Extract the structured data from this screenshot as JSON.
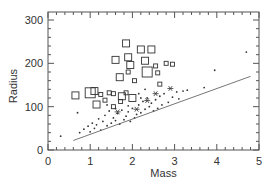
{
  "chart_data": {
    "type": "scatter",
    "title": "",
    "xlabel": "Mass",
    "ylabel": "Radius",
    "xlim": [
      0,
      5
    ],
    "ylim": [
      0,
      300
    ],
    "x_ticks": [
      0,
      1,
      2,
      3,
      4,
      5
    ],
    "x_tick_labels": [
      "0",
      "1",
      "2",
      "3",
      "4",
      "5"
    ],
    "y_ticks": [
      0,
      100,
      200,
      300
    ],
    "y_tick_labels": [
      "0",
      "100",
      "200",
      "300"
    ],
    "x_minor_step": 0.2,
    "y_minor_step": 20,
    "grid": false,
    "legend": null,
    "colors": {
      "marks": "#333333",
      "axis": "#555555",
      "fit_line": "#666666"
    },
    "series": [
      {
        "name": "squares",
        "marker": "open-square",
        "points": [
          {
            "x": 0.65,
            "y": 126,
            "s": 2
          },
          {
            "x": 1.0,
            "y": 132,
            "s": 3
          },
          {
            "x": 1.1,
            "y": 136,
            "s": 2
          },
          {
            "x": 1.15,
            "y": 105,
            "s": 2
          },
          {
            "x": 1.25,
            "y": 128,
            "s": 1
          },
          {
            "x": 1.45,
            "y": 132,
            "s": 1
          },
          {
            "x": 1.55,
            "y": 130,
            "s": 1
          },
          {
            "x": 1.6,
            "y": 208,
            "s": 2
          },
          {
            "x": 1.7,
            "y": 168,
            "s": 2
          },
          {
            "x": 1.75,
            "y": 124,
            "s": 2
          },
          {
            "x": 1.85,
            "y": 246,
            "s": 2
          },
          {
            "x": 1.9,
            "y": 214,
            "s": 2
          },
          {
            "x": 1.95,
            "y": 196,
            "s": 2
          },
          {
            "x": 1.9,
            "y": 180,
            "s": 1
          },
          {
            "x": 1.85,
            "y": 132,
            "s": 1
          },
          {
            "x": 2.0,
            "y": 120,
            "s": 2
          },
          {
            "x": 2.05,
            "y": 160,
            "s": 1
          },
          {
            "x": 2.2,
            "y": 232,
            "s": 2
          },
          {
            "x": 2.3,
            "y": 206,
            "s": 2
          },
          {
            "x": 2.35,
            "y": 180,
            "s": 3
          },
          {
            "x": 2.45,
            "y": 232,
            "s": 2
          },
          {
            "x": 2.55,
            "y": 194,
            "s": 1
          },
          {
            "x": 2.6,
            "y": 178,
            "s": 1
          },
          {
            "x": 2.65,
            "y": 152,
            "s": 1
          },
          {
            "x": 2.8,
            "y": 200,
            "s": 1
          },
          {
            "x": 2.95,
            "y": 198,
            "s": 1
          },
          {
            "x": 1.35,
            "y": 115,
            "s": 1
          },
          {
            "x": 1.55,
            "y": 100,
            "s": 1
          },
          {
            "x": 1.72,
            "y": 112,
            "s": 1
          }
        ]
      },
      {
        "name": "dots",
        "marker": "dot",
        "points": [
          {
            "x": 0.3,
            "y": 32
          },
          {
            "x": 0.7,
            "y": 86
          },
          {
            "x": 0.75,
            "y": 40
          },
          {
            "x": 0.85,
            "y": 48
          },
          {
            "x": 0.95,
            "y": 55
          },
          {
            "x": 1.0,
            "y": 42
          },
          {
            "x": 1.05,
            "y": 62
          },
          {
            "x": 1.1,
            "y": 50
          },
          {
            "x": 1.15,
            "y": 58
          },
          {
            "x": 1.2,
            "y": 72
          },
          {
            "x": 1.25,
            "y": 46
          },
          {
            "x": 1.3,
            "y": 66
          },
          {
            "x": 1.35,
            "y": 80
          },
          {
            "x": 1.4,
            "y": 56
          },
          {
            "x": 1.45,
            "y": 90
          },
          {
            "x": 1.5,
            "y": 62
          },
          {
            "x": 1.55,
            "y": 74
          },
          {
            "x": 1.6,
            "y": 68
          },
          {
            "x": 1.65,
            "y": 84
          },
          {
            "x": 1.7,
            "y": 60
          },
          {
            "x": 1.75,
            "y": 92
          },
          {
            "x": 1.8,
            "y": 70
          },
          {
            "x": 1.85,
            "y": 78
          },
          {
            "x": 1.9,
            "y": 88
          },
          {
            "x": 1.95,
            "y": 66
          },
          {
            "x": 2.0,
            "y": 96
          },
          {
            "x": 2.05,
            "y": 74
          },
          {
            "x": 2.1,
            "y": 82
          },
          {
            "x": 2.15,
            "y": 104
          },
          {
            "x": 2.2,
            "y": 86
          },
          {
            "x": 2.25,
            "y": 112
          },
          {
            "x": 2.3,
            "y": 94
          },
          {
            "x": 2.35,
            "y": 120
          },
          {
            "x": 2.4,
            "y": 100
          },
          {
            "x": 2.45,
            "y": 108
          },
          {
            "x": 2.5,
            "y": 90
          },
          {
            "x": 2.55,
            "y": 116
          },
          {
            "x": 2.6,
            "y": 96
          },
          {
            "x": 2.65,
            "y": 124
          },
          {
            "x": 2.7,
            "y": 104
          },
          {
            "x": 2.75,
            "y": 130
          },
          {
            "x": 2.85,
            "y": 110
          },
          {
            "x": 2.95,
            "y": 122
          },
          {
            "x": 3.05,
            "y": 134
          },
          {
            "x": 3.1,
            "y": 118
          },
          {
            "x": 3.2,
            "y": 136
          },
          {
            "x": 3.3,
            "y": 138
          },
          {
            "x": 2.15,
            "y": 130
          },
          {
            "x": 2.3,
            "y": 140
          },
          {
            "x": 2.2,
            "y": 120
          },
          {
            "x": 1.9,
            "y": 102
          },
          {
            "x": 1.6,
            "y": 96
          },
          {
            "x": 1.4,
            "y": 104
          },
          {
            "x": 3.7,
            "y": 144
          },
          {
            "x": 3.95,
            "y": 184
          },
          {
            "x": 4.7,
            "y": 226
          }
        ]
      },
      {
        "name": "stars",
        "marker": "asterisk",
        "points": [
          {
            "x": 2.55,
            "y": 130
          },
          {
            "x": 2.1,
            "y": 94
          },
          {
            "x": 1.65,
            "y": 88
          },
          {
            "x": 2.35,
            "y": 114
          },
          {
            "x": 2.9,
            "y": 142
          }
        ]
      }
    ],
    "fit_line": {
      "x": [
        0.6,
        4.8
      ],
      "y": [
        22,
        170
      ]
    }
  }
}
